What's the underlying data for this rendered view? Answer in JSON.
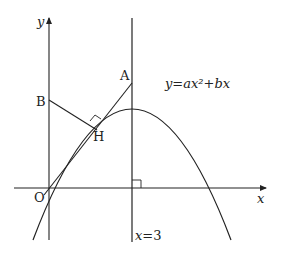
{
  "diagram": {
    "type": "coordinate-geometry",
    "axes": {
      "x_label": "x",
      "y_label": "y",
      "origin_label": "O"
    },
    "curve": {
      "equation": "y=ax²+bx",
      "label_y": "y",
      "label_eq": "=",
      "label_rhs": "ax²+bx"
    },
    "vertical_line": {
      "label": "x=3"
    },
    "points": {
      "A": {
        "label": "A",
        "description": "vertex of parabola on line x=3"
      },
      "B": {
        "label": "B",
        "description": "point on y-axis"
      },
      "H": {
        "label": "H",
        "description": "foot of perpendicular from B to OA"
      },
      "O": {
        "label": "O",
        "description": "origin"
      }
    },
    "segments": [
      "OA",
      "BH"
    ],
    "right_angles": [
      "BH ⊥ OA at H",
      "x=3 ⊥ x-axis"
    ],
    "colors": {
      "stroke": "#222222",
      "background": "#ffffff"
    }
  }
}
